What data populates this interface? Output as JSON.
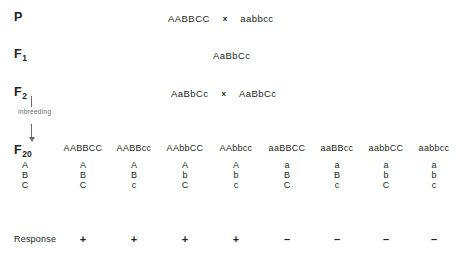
{
  "diagram": {
    "cross_symbol": "x",
    "text_color": "#231f20",
    "accent_color": "#6f6c6b",
    "background_color": "#ffffff"
  },
  "generations": {
    "parental": {
      "label": "P",
      "label_sub": "",
      "left_genotype": "AABBCC",
      "right_genotype": "aabbcc"
    },
    "f1": {
      "label": "F",
      "label_sub": "1",
      "genotype": "AaBbCc"
    },
    "f2": {
      "label": "F",
      "label_sub": "2",
      "left_genotype": "AaBbCc",
      "right_genotype": "AaBbCc"
    },
    "f20": {
      "label": "F",
      "label_sub": "20",
      "allele_stack": [
        "A",
        "B",
        "C"
      ]
    }
  },
  "inbreeding": {
    "caption": "inbreeding",
    "direction": "down"
  },
  "columns": [
    {
      "genotype": "AABBCC",
      "alleles": [
        "A",
        "B",
        "C"
      ],
      "response": "+"
    },
    {
      "genotype": "AABBcc",
      "alleles": [
        "A",
        "B",
        "c"
      ],
      "response": "+"
    },
    {
      "genotype": "AAbbCC",
      "alleles": [
        "A",
        "b",
        "C"
      ],
      "response": "+"
    },
    {
      "genotype": "AAbbcc",
      "alleles": [
        "A",
        "b",
        "c"
      ],
      "response": "+"
    },
    {
      "genotype": "aaBBCC",
      "alleles": [
        "a",
        "B",
        "C"
      ],
      "response": "–"
    },
    {
      "genotype": "aaBBcc",
      "alleles": [
        "a",
        "B",
        "c"
      ],
      "response": "–"
    },
    {
      "genotype": "aabbCC",
      "alleles": [
        "a",
        "b",
        "C"
      ],
      "response": "–"
    },
    {
      "genotype": "aabbcc",
      "alleles": [
        "a",
        "b",
        "c"
      ],
      "response": "–"
    }
  ],
  "response_row": {
    "label": "Response",
    "positive_symbol": "+",
    "negative_symbol": "–"
  }
}
